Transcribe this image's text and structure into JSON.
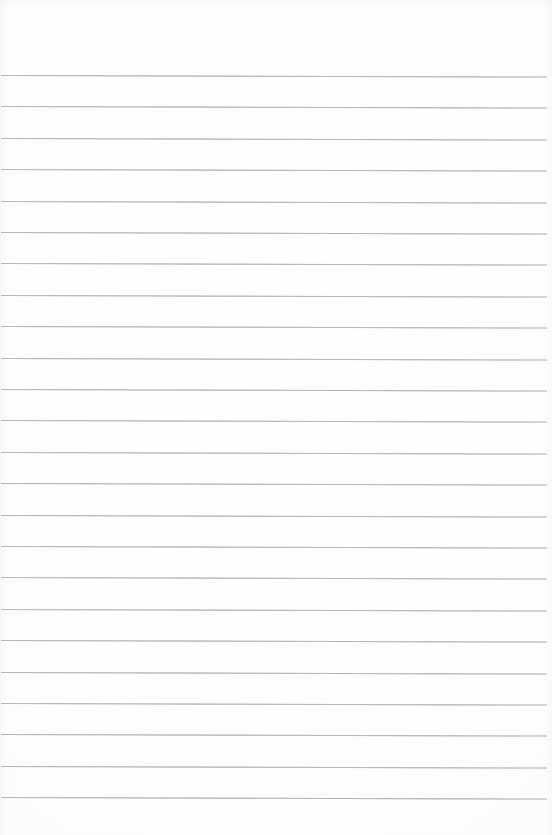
{
  "document": {
    "type": "scanned-ruled-paper",
    "kind": "blank-lined-notebook-page",
    "title": "",
    "body_text": "",
    "has_text": false,
    "has_margin_rule": false,
    "has_header_rule": false,
    "page_width": 552,
    "page_height": 835
  },
  "colors": {
    "paper": "#fdfdfd",
    "rule_line": "#a9a9ae",
    "page_edge_shadow": "#000000"
  },
  "layout": {
    "first_line_y": 75,
    "line_spacing": 31.4,
    "line_count": 24,
    "line_thickness": 1,
    "line_start_x": 1,
    "line_end_x": 547,
    "top_margin": 75,
    "bottom_margin": 27,
    "skew_degrees": 0.16
  },
  "rules": [
    {
      "index": 1,
      "y": 75,
      "label": "ruled-line-1"
    },
    {
      "index": 2,
      "y": 106.4,
      "label": "ruled-line-2"
    },
    {
      "index": 3,
      "y": 137.8,
      "label": "ruled-line-3"
    },
    {
      "index": 4,
      "y": 169.2,
      "label": "ruled-line-4"
    },
    {
      "index": 5,
      "y": 200.6,
      "label": "ruled-line-5"
    },
    {
      "index": 6,
      "y": 232.0,
      "label": "ruled-line-6"
    },
    {
      "index": 7,
      "y": 263.4,
      "label": "ruled-line-7"
    },
    {
      "index": 8,
      "y": 294.8,
      "label": "ruled-line-8"
    },
    {
      "index": 9,
      "y": 326.2,
      "label": "ruled-line-9"
    },
    {
      "index": 10,
      "y": 357.6,
      "label": "ruled-line-10"
    },
    {
      "index": 11,
      "y": 389.0,
      "label": "ruled-line-11"
    },
    {
      "index": 12,
      "y": 420.4,
      "label": "ruled-line-12"
    },
    {
      "index": 13,
      "y": 451.8,
      "label": "ruled-line-13"
    },
    {
      "index": 14,
      "y": 483.2,
      "label": "ruled-line-14"
    },
    {
      "index": 15,
      "y": 514.6,
      "label": "ruled-line-15"
    },
    {
      "index": 16,
      "y": 546.0,
      "label": "ruled-line-16"
    },
    {
      "index": 17,
      "y": 577.4,
      "label": "ruled-line-17"
    },
    {
      "index": 18,
      "y": 608.8,
      "label": "ruled-line-18"
    },
    {
      "index": 19,
      "y": 640.2,
      "label": "ruled-line-19"
    },
    {
      "index": 20,
      "y": 671.6,
      "label": "ruled-line-20"
    },
    {
      "index": 21,
      "y": 703.0,
      "label": "ruled-line-21"
    },
    {
      "index": 22,
      "y": 734.4,
      "label": "ruled-line-22"
    },
    {
      "index": 23,
      "y": 765.8,
      "label": "ruled-line-23"
    },
    {
      "index": 24,
      "y": 797.2,
      "label": "ruled-line-24"
    }
  ]
}
